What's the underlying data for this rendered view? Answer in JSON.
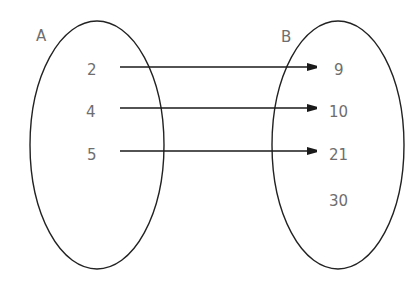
{
  "diagram": {
    "type": "mapping-diagram",
    "colors": {
      "stroke": "#222222",
      "text": "#6e6e6e",
      "background": "#ffffff"
    },
    "sets": [
      {
        "name": "A",
        "elements": [
          "2",
          "4",
          "5"
        ]
      },
      {
        "name": "B",
        "elements": [
          "9",
          "10",
          "21",
          "30"
        ]
      }
    ],
    "mappings": [
      {
        "from": "2",
        "to": "9"
      },
      {
        "from": "4",
        "to": "10"
      },
      {
        "from": "5",
        "to": "21"
      }
    ]
  }
}
